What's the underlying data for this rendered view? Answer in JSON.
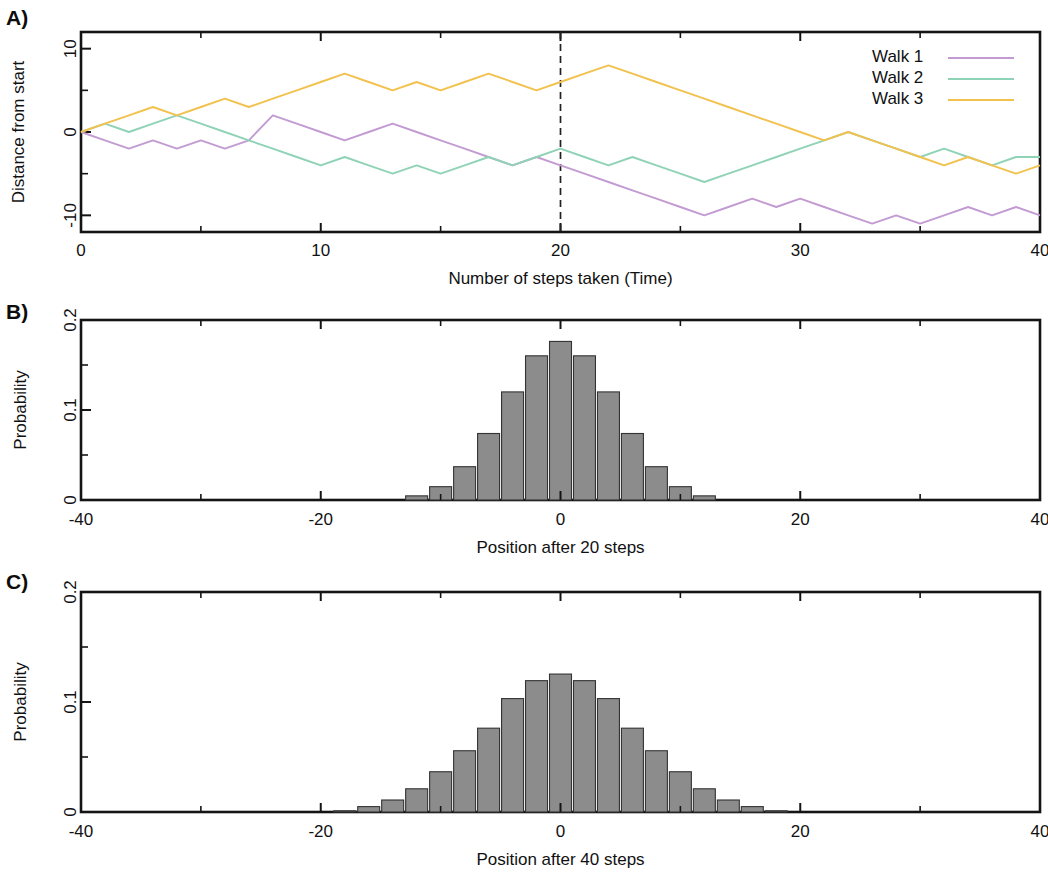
{
  "figure": {
    "panels": [
      {
        "letter": "A)"
      },
      {
        "letter": "B)"
      },
      {
        "letter": "C)"
      }
    ]
  },
  "panelA": {
    "letter": "A)",
    "ylabel": "Distance from start",
    "xlabel": "Number of steps taken (Time)",
    "xticks": [
      "0",
      "10",
      "20",
      "30",
      "40"
    ],
    "yticks": [
      "10",
      "0",
      "-10"
    ],
    "legend": [
      {
        "label": "Walk 1",
        "color": "#c39bd3"
      },
      {
        "label": "Walk 2",
        "color": "#8fd3b6"
      },
      {
        "label": "Walk 3",
        "color": "#f2c14e"
      }
    ],
    "marker_line_x": 20
  },
  "panelB": {
    "letter": "B)",
    "ylabel": "Probability",
    "xlabel": "Position after 20 steps",
    "xticks": [
      "-40",
      "-20",
      "0",
      "20",
      "40"
    ],
    "yticks": [
      "0.2",
      "0.1",
      "0"
    ]
  },
  "panelC": {
    "letter": "C)",
    "ylabel": "Probability",
    "xlabel": "Position after 40 steps",
    "xticks": [
      "-40",
      "-20",
      "0",
      "20",
      "40"
    ],
    "yticks": [
      "0.2",
      "0.1",
      "0"
    ]
  },
  "chart_data": [
    {
      "type": "line",
      "panel": "A",
      "title": "",
      "xlabel": "Number of steps taken (Time)",
      "ylabel": "Distance from start",
      "xlim": [
        0,
        40
      ],
      "ylim": [
        -12,
        12
      ],
      "xticks": [
        0,
        10,
        20,
        30,
        40
      ],
      "yticks": [
        -10,
        0,
        10
      ],
      "minor_yticks": [
        -5,
        5
      ],
      "grid": false,
      "legend_position": "top-right",
      "annotations": [
        {
          "type": "vline",
          "x": 20,
          "style": "dashed",
          "color": "#222222"
        }
      ],
      "x": [
        0,
        1,
        2,
        3,
        4,
        5,
        6,
        7,
        8,
        9,
        10,
        11,
        12,
        13,
        14,
        15,
        16,
        17,
        18,
        19,
        20,
        21,
        22,
        23,
        24,
        25,
        26,
        27,
        28,
        29,
        30,
        31,
        32,
        33,
        34,
        35,
        36,
        37,
        38,
        39,
        40
      ],
      "series": [
        {
          "name": "Walk 1",
          "color": "#c39bd3",
          "values": [
            0,
            -1,
            -2,
            -1,
            -2,
            -1,
            -2,
            -1,
            2,
            1,
            0,
            -1,
            0,
            1,
            0,
            -1,
            -2,
            -3,
            -4,
            -3,
            -4,
            -5,
            -6,
            -7,
            -8,
            -9,
            -10,
            -9,
            -8,
            -9,
            -8,
            -9,
            -10,
            -11,
            -10,
            -11,
            -10,
            -9,
            -10,
            -9,
            -10
          ]
        },
        {
          "name": "Walk 2",
          "color": "#8fd3b6",
          "values": [
            0,
            1,
            0,
            1,
            2,
            1,
            0,
            -1,
            -2,
            -3,
            -4,
            -3,
            -4,
            -5,
            -4,
            -5,
            -4,
            -3,
            -4,
            -3,
            -2,
            -3,
            -4,
            -3,
            -4,
            -5,
            -6,
            -5,
            -4,
            -3,
            -2,
            -1,
            0,
            -1,
            -2,
            -3,
            -2,
            -3,
            -4,
            -3,
            -3
          ]
        },
        {
          "name": "Walk 3",
          "color": "#f2c14e",
          "values": [
            0,
            1,
            2,
            3,
            2,
            3,
            4,
            3,
            4,
            5,
            6,
            7,
            6,
            5,
            6,
            5,
            6,
            7,
            6,
            5,
            6,
            7,
            8,
            7,
            6,
            5,
            4,
            3,
            2,
            1,
            0,
            -1,
            0,
            -1,
            -2,
            -3,
            -4,
            -3,
            -4,
            -5,
            -4
          ]
        }
      ]
    },
    {
      "type": "bar",
      "panel": "B",
      "title": "",
      "xlabel": "Position after 20 steps",
      "ylabel": "Probability",
      "xlim": [
        -40,
        40
      ],
      "ylim": [
        0,
        0.2
      ],
      "xticks": [
        -40,
        -20,
        0,
        20,
        40
      ],
      "yticks": [
        0,
        0.1,
        0.2
      ],
      "minor_yticks": [
        0.05,
        0.15
      ],
      "minor_xticks": [
        -30,
        -10,
        10,
        30
      ],
      "grid": false,
      "bar_color": "#8c8c8c",
      "bar_edge_color": "#333333",
      "bin_width": 2,
      "categories": [
        -12,
        -10,
        -8,
        -6,
        -4,
        -2,
        0,
        2,
        4,
        6,
        8,
        10,
        12
      ],
      "values": [
        0.0046,
        0.0148,
        0.037,
        0.0739,
        0.1201,
        0.1602,
        0.1762,
        0.1602,
        0.1201,
        0.0739,
        0.037,
        0.0148,
        0.0046
      ]
    },
    {
      "type": "bar",
      "panel": "C",
      "title": "",
      "xlabel": "Position after 40 steps",
      "ylabel": "Probability",
      "xlim": [
        -40,
        40
      ],
      "ylim": [
        0,
        0.2
      ],
      "xticks": [
        -40,
        -20,
        0,
        20,
        40
      ],
      "yticks": [
        0,
        0.1,
        0.2
      ],
      "minor_yticks": [
        0.05,
        0.15
      ],
      "minor_xticks": [
        -30,
        -10,
        10,
        30
      ],
      "grid": false,
      "bar_color": "#8c8c8c",
      "bar_edge_color": "#333333",
      "bin_width": 2,
      "categories": [
        -18,
        -16,
        -14,
        -12,
        -10,
        -8,
        -6,
        -4,
        -2,
        0,
        2,
        4,
        6,
        8,
        10,
        12,
        14,
        16,
        18
      ],
      "values": [
        0.0011,
        0.0049,
        0.0109,
        0.0211,
        0.0366,
        0.0557,
        0.0762,
        0.1031,
        0.1194,
        0.1254,
        0.1194,
        0.1031,
        0.0762,
        0.0557,
        0.0366,
        0.0211,
        0.0109,
        0.0049,
        0.0011
      ]
    }
  ]
}
